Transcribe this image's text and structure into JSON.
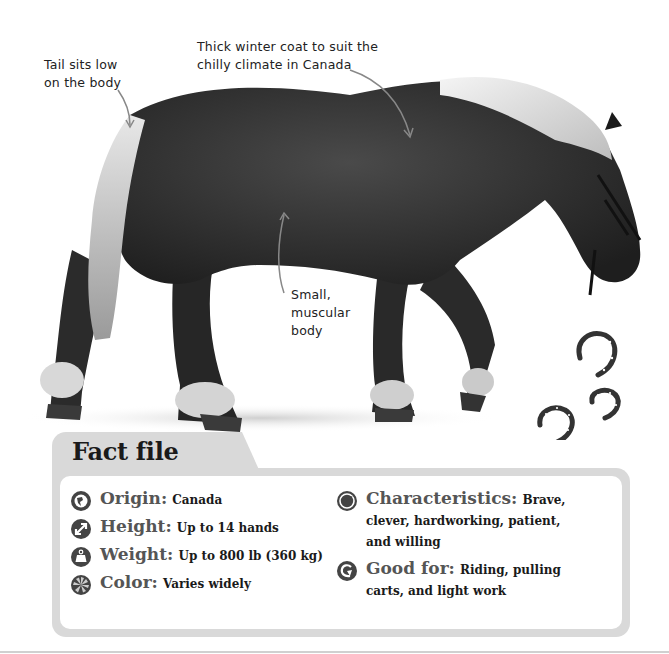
{
  "annotations": [
    {
      "id": "tail",
      "lines": [
        "Tail sits low",
        "on the body"
      ]
    },
    {
      "id": "coat",
      "lines": [
        "Thick winter coat to suit the",
        "chilly climate in Canada"
      ]
    },
    {
      "id": "body",
      "lines": [
        "Small,",
        "muscular",
        "body"
      ]
    }
  ],
  "fact_file": {
    "title": "Fact file",
    "left": [
      {
        "icon": "globe-icon",
        "label": "Origin:",
        "value": "Canada"
      },
      {
        "icon": "height-arrows-icon",
        "label": "Height:",
        "value": "Up to 14 hands"
      },
      {
        "icon": "weight-icon",
        "label": "Weight:",
        "value": "Up to 800 lb (360 kg)"
      },
      {
        "icon": "color-palette-icon",
        "label": "Color:",
        "value": "Varies widely"
      }
    ],
    "right": [
      {
        "icon": "characteristics-icon",
        "label": "Characteristics:",
        "value": "Brave, clever, hardworking, patient, and willing"
      },
      {
        "icon": "horseshoe-icon",
        "label": "Good for:",
        "value": "Riding, pulling carts, and light work"
      }
    ]
  },
  "colors": {
    "card_border": "#d9d9d9",
    "icon_fill": "#444444",
    "label_text": "#555555",
    "value_text": "#1a1a1a"
  }
}
